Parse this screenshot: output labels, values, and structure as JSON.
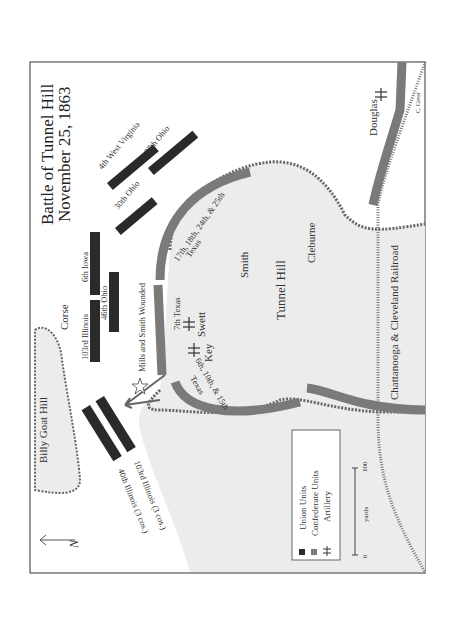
{
  "map": {
    "title": "Battle of Tunnel Hill",
    "date": "November 25, 1863",
    "credit": "C. Grear",
    "places": {
      "tunnel_hill": "Tunnel Hill",
      "billy_goat_hill": "Billy Goat Hill",
      "railroad": "Chattanooga & Cleveland Railroad"
    },
    "commanders": {
      "corse": "Corse",
      "smith": "Smith",
      "cleburne": "Cleburne",
      "swett": "Swett",
      "key": "Key",
      "douglas": "Douglas"
    },
    "union_units": {
      "u4wv": "4th West Virginia",
      "u37oh": "37th Ohio",
      "u30oh": "30th Ohio",
      "u6ia": "6th Iowa",
      "u46oh": "46th Ohio",
      "u103il": "103rd Illinois",
      "u103il_cos": "103rd Illinois (3 cos.)",
      "u40il_cos": "40th Illinois (3 cos.)"
    },
    "confederate_units": {
      "c17tx": "17th, 18th, 24th, & 25th",
      "c17tx_b": "Texas",
      "c7tx": "7th Texas",
      "c6tx": "6th, 10th, & 15th",
      "c6tx_b": "Texas"
    },
    "annotation": "Mills and Smith Wounded",
    "north_label": "N",
    "legend": {
      "items": [
        "Union Units",
        "Confederate Units",
        "Artillery"
      ],
      "scale_unit": "yards",
      "scale_min": "0",
      "scale_max": "100"
    },
    "colors": {
      "union": "#2a2a2a",
      "confederate": "#7a7a7a",
      "hill_fill": "#ececec",
      "border": "#555555"
    }
  }
}
